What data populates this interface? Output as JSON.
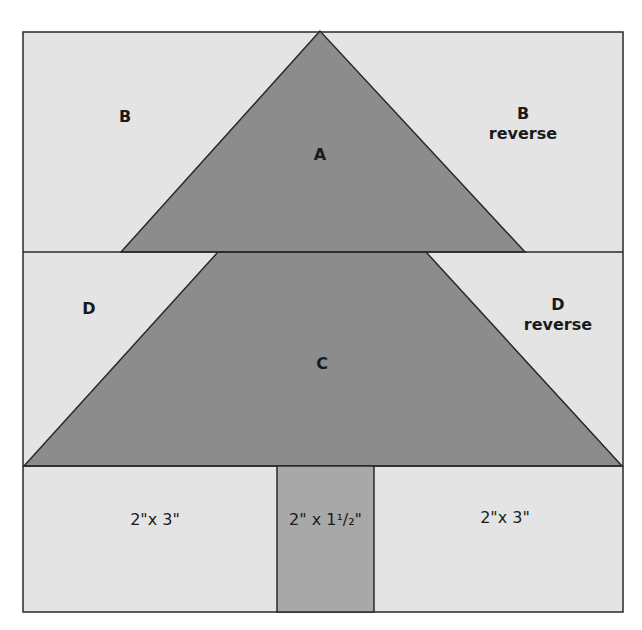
{
  "diagram": {
    "colors": {
      "background_piece": "#e4e4e4",
      "tree_piece": "#8c8c8c",
      "trunk_piece": "#a8a8a8",
      "outline": "#2a2a2a"
    },
    "pieces": {
      "A": {
        "label": "A"
      },
      "B": {
        "label": "B"
      },
      "B_reverse": {
        "label": "B",
        "sublabel": "reverse"
      },
      "C": {
        "label": "C"
      },
      "D": {
        "label": "D"
      },
      "D_reverse": {
        "label": "D",
        "sublabel": "reverse"
      },
      "bottom_left": {
        "label": "2\"x 3\""
      },
      "trunk": {
        "label": "2\" x 1¹/₂\""
      },
      "bottom_right": {
        "label": "2\"x 3\""
      }
    }
  }
}
